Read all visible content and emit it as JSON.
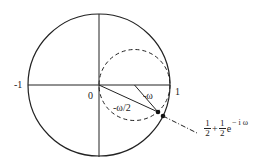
{
  "diagram": {
    "type": "unit-circle-map",
    "labels": {
      "minus_one": "-1",
      "origin": "0",
      "one": "1",
      "angle_omega": "-ω",
      "angle_half_omega": "-ω/2"
    },
    "formula": {
      "frac1_num": "1",
      "frac1_den": "2",
      "plus": "+",
      "frac2_num": "1",
      "frac2_den": "2",
      "base": "e",
      "exponent": "− i ω"
    },
    "colors": {
      "stroke": "#222222",
      "background": "#ffffff"
    }
  }
}
